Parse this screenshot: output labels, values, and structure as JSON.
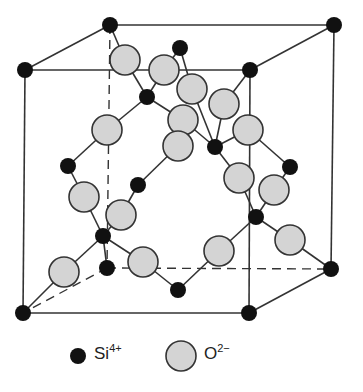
{
  "diagram": {
    "type": "crystal-structure-unit-cell",
    "colors": {
      "si": "#111111",
      "o_fill": "#d4d4d4",
      "o_stroke": "#333333",
      "line": "#333333"
    },
    "cube": {
      "corners": {
        "back_top_left": [
          110,
          25
        ],
        "back_top_right": [
          334,
          25
        ],
        "front_top_left": [
          25,
          70
        ],
        "front_top_right": [
          250,
          70
        ],
        "front_bottom_left": [
          23,
          313
        ],
        "front_bottom_right": [
          249,
          313
        ],
        "back_bottom_right": [
          331,
          269
        ],
        "back_bottom_left": [
          107,
          268
        ]
      }
    },
    "si_atoms": [
      [
        110,
        25
      ],
      [
        334,
        25
      ],
      [
        25,
        70
      ],
      [
        250,
        70
      ],
      [
        23,
        313
      ],
      [
        249,
        313
      ],
      [
        331,
        269
      ],
      [
        180,
        48
      ],
      [
        147,
        97
      ],
      [
        215,
        147
      ],
      [
        68,
        166
      ],
      [
        138,
        185
      ],
      [
        290,
        167
      ],
      [
        103,
        236
      ],
      [
        256,
        217
      ],
      [
        178,
        290
      ],
      [
        107,
        268
      ]
    ],
    "o_atoms": [
      [
        125,
        60
      ],
      [
        164,
        70
      ],
      [
        192,
        89
      ],
      [
        224,
        104
      ],
      [
        107,
        130
      ],
      [
        183,
        120
      ],
      [
        178,
        146
      ],
      [
        248,
        130
      ],
      [
        239,
        178
      ],
      [
        274,
        190
      ],
      [
        84,
        197
      ],
      [
        121,
        215
      ],
      [
        290,
        240
      ],
      [
        64,
        272
      ],
      [
        143,
        262
      ],
      [
        219,
        251
      ]
    ]
  },
  "legend": {
    "si": {
      "symbol": "Si",
      "charge": "4+"
    },
    "o": {
      "symbol": "O",
      "charge": "2−"
    }
  }
}
